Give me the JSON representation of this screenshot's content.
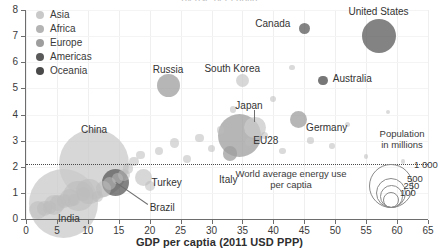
{
  "chart": {
    "top_title_clipped": "gy use per captia",
    "xlabel": "GDP per captia (2011 USD PPP)",
    "ylabel": ""
  },
  "legend": {
    "items": [
      {
        "label": "Asia",
        "color": "#c9c9c9"
      },
      {
        "label": "Africa",
        "color": "#b4b4b4"
      },
      {
        "label": "Europe",
        "color": "#9e9e9e"
      },
      {
        "label": "Americas",
        "color": "#5a5a5a"
      },
      {
        "label": "Oceania",
        "color": "#4a4a4a"
      }
    ]
  },
  "annotations": {
    "world_average_line1": "World average energy use",
    "world_average_line2": "per captia"
  },
  "size_legend": {
    "title_line1": "Population",
    "title_line2": "in millions",
    "values": [
      "1 000",
      "500",
      "250",
      "100"
    ]
  },
  "axis_ticks": {
    "x": [
      "0",
      "5",
      "10",
      "15",
      "20",
      "25",
      "30",
      "35",
      "40",
      "45",
      "50",
      "55",
      "60",
      "65"
    ],
    "y": [
      "0",
      "1",
      "2",
      "3",
      "4",
      "5",
      "6",
      "7",
      "8"
    ]
  },
  "chart_data": {
    "type": "scatter",
    "xlabel": "GDP per captia (2011 USD PPP)",
    "ylabel": "Energy use per captia (toe)",
    "xlim": [
      0,
      65
    ],
    "ylim": [
      0,
      8
    ],
    "grid": true,
    "legend_position": "top-left",
    "bubble_encoding": "Population in millions",
    "reference_line": {
      "y": 1.9,
      "label": "World average energy use per captia",
      "style": "dotted"
    },
    "labelled_points": [
      {
        "name": "United States",
        "x": 57.0,
        "y": 7.0,
        "population": 320,
        "continent": "Americas"
      },
      {
        "name": "Canada",
        "x": 45.0,
        "y": 7.3,
        "population": 36,
        "continent": "Americas"
      },
      {
        "name": "Australia",
        "x": 48.0,
        "y": 5.3,
        "population": 24,
        "continent": "Oceania"
      },
      {
        "name": "South Korea",
        "x": 35.0,
        "y": 5.3,
        "population": 51,
        "continent": "Asia"
      },
      {
        "name": "Russia",
        "x": 23.0,
        "y": 5.1,
        "population": 144,
        "continent": "Europe"
      },
      {
        "name": "Japan",
        "x": 37.0,
        "y": 3.5,
        "population": 127,
        "continent": "Asia"
      },
      {
        "name": "Germany",
        "x": 44.0,
        "y": 3.8,
        "population": 82,
        "continent": "Europe"
      },
      {
        "name": "EU28",
        "x": 34.5,
        "y": 3.2,
        "population": 510,
        "continent": "Europe"
      },
      {
        "name": "Italy",
        "x": 33.0,
        "y": 2.5,
        "population": 60,
        "continent": "Europe"
      },
      {
        "name": "Turkey",
        "x": 19.0,
        "y": 1.6,
        "population": 79,
        "continent": "Asia"
      },
      {
        "name": "China",
        "x": 11.0,
        "y": 2.1,
        "population": 1380,
        "continent": "Asia"
      },
      {
        "name": "Brazil",
        "x": 14.5,
        "y": 1.4,
        "population": 208,
        "continent": "Americas"
      },
      {
        "name": "India",
        "x": 6.0,
        "y": 0.6,
        "population": 1320,
        "continent": "Asia"
      }
    ],
    "unlabelled_points": [
      {
        "x": 2.0,
        "y": 0.35,
        "population": 90
      },
      {
        "x": 3.0,
        "y": 0.4,
        "population": 60
      },
      {
        "x": 3.8,
        "y": 0.45,
        "population": 45
      },
      {
        "x": 4.5,
        "y": 0.55,
        "population": 110
      },
      {
        "x": 5.2,
        "y": 0.62,
        "population": 70
      },
      {
        "x": 6.2,
        "y": 0.7,
        "population": 55
      },
      {
        "x": 7.0,
        "y": 0.8,
        "population": 95
      },
      {
        "x": 7.8,
        "y": 0.72,
        "population": 40
      },
      {
        "x": 8.5,
        "y": 0.88,
        "population": 260
      },
      {
        "x": 9.3,
        "y": 0.95,
        "population": 50
      },
      {
        "x": 10.2,
        "y": 1.05,
        "population": 180
      },
      {
        "x": 11.5,
        "y": 0.85,
        "population": 35
      },
      {
        "x": 12.5,
        "y": 1.15,
        "population": 65
      },
      {
        "x": 13.5,
        "y": 1.35,
        "population": 48
      },
      {
        "x": 14.8,
        "y": 1.55,
        "population": 30
      },
      {
        "x": 15.8,
        "y": 1.7,
        "population": 40
      },
      {
        "x": 16.5,
        "y": 1.95,
        "population": 33
      },
      {
        "x": 17.5,
        "y": 2.2,
        "population": 25
      },
      {
        "x": 18.5,
        "y": 2.45,
        "population": 22
      },
      {
        "x": 20.0,
        "y": 1.25,
        "population": 28
      },
      {
        "x": 21.5,
        "y": 2.6,
        "population": 20
      },
      {
        "x": 24.0,
        "y": 2.9,
        "population": 26
      },
      {
        "x": 26.0,
        "y": 2.3,
        "population": 18
      },
      {
        "x": 28.0,
        "y": 3.1,
        "population": 21
      },
      {
        "x": 30.0,
        "y": 2.7,
        "population": 17
      },
      {
        "x": 31.5,
        "y": 3.4,
        "population": 15
      },
      {
        "x": 33.5,
        "y": 4.2,
        "population": 12
      },
      {
        "x": 36.0,
        "y": 2.95,
        "population": 19
      },
      {
        "x": 38.5,
        "y": 3.2,
        "population": 14
      },
      {
        "x": 40.0,
        "y": 4.6,
        "population": 10
      },
      {
        "x": 41.5,
        "y": 2.6,
        "population": 13
      },
      {
        "x": 43.0,
        "y": 5.8,
        "population": 9
      },
      {
        "x": 46.0,
        "y": 3.0,
        "population": 11
      },
      {
        "x": 49.5,
        "y": 2.8,
        "population": 8
      },
      {
        "x": 52.0,
        "y": 3.6,
        "population": 7
      },
      {
        "x": 55.0,
        "y": 2.4,
        "population": 6
      },
      {
        "x": 58.5,
        "y": 4.1,
        "population": 5
      },
      {
        "x": 61.0,
        "y": 2.2,
        "population": 5
      }
    ]
  }
}
